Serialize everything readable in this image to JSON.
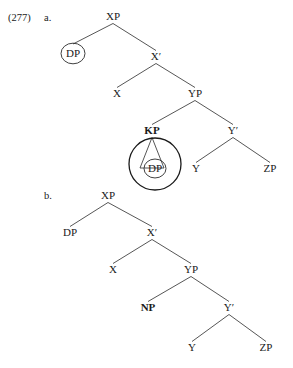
{
  "figure": {
    "example_number": "(277)",
    "trees": [
      {
        "id": "tree-a",
        "label": "a.",
        "label_pos": {
          "x": 44,
          "y": 21
        },
        "nodes": [
          {
            "id": "a-xp",
            "text": "XP",
            "x": 113,
            "y": 20,
            "bold": false,
            "circled": false
          },
          {
            "id": "a-dp",
            "text": "DP",
            "x": 73,
            "y": 57,
            "bold": false,
            "circled": true,
            "circle_r": 12
          },
          {
            "id": "a-xbar",
            "text": "X′",
            "x": 156,
            "y": 60,
            "bold": false,
            "circled": false
          },
          {
            "id": "a-x",
            "text": "X",
            "x": 117,
            "y": 97,
            "bold": false,
            "circled": false
          },
          {
            "id": "a-yp",
            "text": "YP",
            "x": 195,
            "y": 97,
            "bold": false,
            "circled": false
          },
          {
            "id": "a-kp",
            "text": "KP",
            "x": 152,
            "y": 134,
            "bold": true,
            "circled": false
          },
          {
            "id": "a-ybar",
            "text": "Y′",
            "x": 233,
            "y": 134,
            "bold": false,
            "circled": false
          },
          {
            "id": "a-dp2",
            "text": "DP",
            "x": 155,
            "y": 172,
            "bold": false,
            "circled": true,
            "circle_r": 11
          },
          {
            "id": "a-y",
            "text": "Y",
            "x": 196,
            "y": 172,
            "bold": false,
            "circled": false
          },
          {
            "id": "a-zp",
            "text": "ZP",
            "x": 270,
            "y": 172,
            "bold": false,
            "circled": false
          }
        ],
        "branches": [
          {
            "from": "a-xp",
            "to": "a-dp"
          },
          {
            "from": "a-xp",
            "to": "a-xbar"
          },
          {
            "from": "a-xbar",
            "to": "a-x"
          },
          {
            "from": "a-xbar",
            "to": "a-yp"
          },
          {
            "from": "a-yp",
            "to": "a-kp"
          },
          {
            "from": "a-yp",
            "to": "a-ybar"
          },
          {
            "from": "a-ybar",
            "to": "a-y"
          },
          {
            "from": "a-ybar",
            "to": "a-zp"
          }
        ],
        "triangles": [
          {
            "apex_node": "a-kp",
            "base_y": 168,
            "half_width": 12
          }
        ],
        "highlight_rings": [
          {
            "cx": 155,
            "cy": 164,
            "rx": 26,
            "ry": 26
          }
        ]
      },
      {
        "id": "tree-b",
        "label": "b.",
        "label_pos": {
          "x": 44,
          "y": 199
        },
        "nodes": [
          {
            "id": "b-xp",
            "text": "XP",
            "x": 108,
            "y": 199,
            "bold": false,
            "circled": false
          },
          {
            "id": "b-dp",
            "text": "DP",
            "x": 70,
            "y": 236,
            "bold": false,
            "circled": false
          },
          {
            "id": "b-xbar",
            "text": "X′",
            "x": 152,
            "y": 236,
            "bold": false,
            "circled": false
          },
          {
            "id": "b-x",
            "text": "X",
            "x": 113,
            "y": 273,
            "bold": false,
            "circled": false
          },
          {
            "id": "b-yp",
            "text": "YP",
            "x": 191,
            "y": 273,
            "bold": false,
            "circled": false
          },
          {
            "id": "b-np",
            "text": "NP",
            "x": 148,
            "y": 311,
            "bold": true,
            "circled": false
          },
          {
            "id": "b-ybar",
            "text": "Y′",
            "x": 229,
            "y": 311,
            "bold": false,
            "circled": false
          },
          {
            "id": "b-y",
            "text": "Y",
            "x": 192,
            "y": 351,
            "bold": false,
            "circled": false
          },
          {
            "id": "b-zp",
            "text": "ZP",
            "x": 266,
            "y": 351,
            "bold": false,
            "circled": false
          }
        ],
        "branches": [
          {
            "from": "b-xp",
            "to": "b-dp"
          },
          {
            "from": "b-xp",
            "to": "b-xbar"
          },
          {
            "from": "b-xbar",
            "to": "b-x"
          },
          {
            "from": "b-xbar",
            "to": "b-yp"
          },
          {
            "from": "b-yp",
            "to": "b-np"
          },
          {
            "from": "b-yp",
            "to": "b-ybar"
          },
          {
            "from": "b-ybar",
            "to": "b-y"
          },
          {
            "from": "b-ybar",
            "to": "b-zp"
          }
        ],
        "triangles": [],
        "highlight_rings": []
      }
    ]
  }
}
